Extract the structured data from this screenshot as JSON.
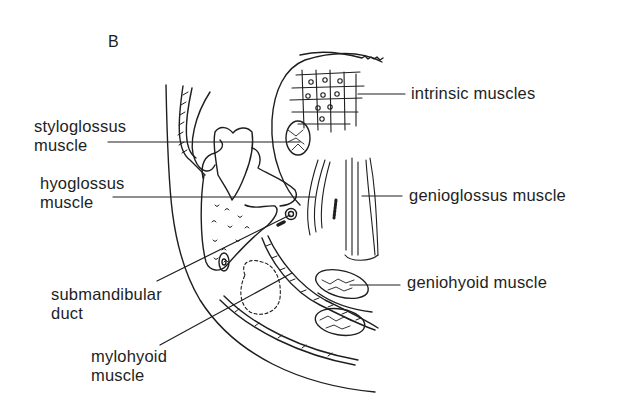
{
  "figure": {
    "panel_label": "B",
    "labels_left": [
      {
        "id": "styloglossus",
        "line1": "styloglossus",
        "line2": "muscle"
      },
      {
        "id": "hyoglossus",
        "line1": "hyoglossus",
        "line2": "muscle"
      },
      {
        "id": "submandibular-duct",
        "line1": "submandibular",
        "line2": "duct"
      },
      {
        "id": "mylohyoid",
        "line1": "mylohyoid",
        "line2": "muscle"
      }
    ],
    "labels_right": [
      {
        "id": "intrinsic",
        "text": "intrinsic muscles"
      },
      {
        "id": "genioglossus",
        "text": "genioglossus muscle"
      },
      {
        "id": "geniohyoid",
        "text": "geniohyoid muscle"
      }
    ],
    "colors": {
      "ink": "#1e1e1e",
      "background": "#ffffff"
    }
  }
}
